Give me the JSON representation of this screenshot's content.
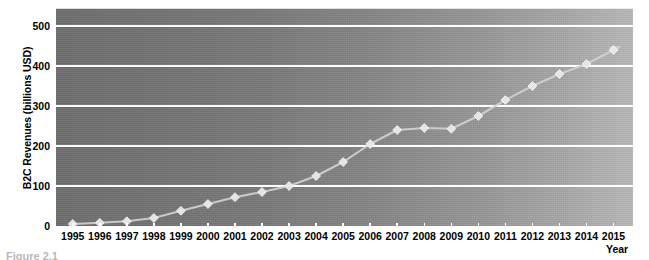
{
  "chart_data": {
    "type": "line",
    "title": "",
    "xlabel": "Year",
    "ylabel": "B2C Revenues (billions USD)",
    "categories": [
      1995,
      1996,
      1997,
      1998,
      1999,
      2000,
      2001,
      2002,
      2003,
      2004,
      2005,
      2006,
      2007,
      2008,
      2009,
      2010,
      2011,
      2012,
      2013,
      2014,
      2015
    ],
    "x_tick_labels": [
      "1995",
      "1996",
      "1997",
      "1998",
      "1999",
      "2000",
      "2001",
      "2002",
      "2003",
      "2004",
      "2005",
      "2006",
      "2007",
      "2008",
      "2009",
      "2010",
      "2011",
      "2012",
      "2013",
      "2014",
      "2015"
    ],
    "values": [
      5,
      8,
      12,
      20,
      38,
      55,
      72,
      85,
      100,
      125,
      160,
      205,
      240,
      245,
      243,
      275,
      315,
      350,
      380,
      405,
      440
    ],
    "series": [
      {
        "name": "B2C Revenues",
        "values": [
          5,
          8,
          12,
          20,
          38,
          55,
          72,
          85,
          100,
          125,
          160,
          205,
          240,
          245,
          243,
          275,
          315,
          350,
          380,
          405,
          440
        ]
      }
    ],
    "ylim": [
      0,
      530
    ],
    "y_ticks": [
      0,
      100,
      200,
      300,
      400,
      500
    ],
    "y_tick_labels": [
      "0",
      "100",
      "200",
      "300",
      "400",
      "500"
    ],
    "xlim": [
      1994.6,
      2015.6
    ],
    "grid": "horizontal",
    "legend": "none",
    "marker": "diamond",
    "line_end_arrow": true,
    "colors": {
      "gridline": "#ffffff",
      "axis": "#ffffff",
      "line": "#d0d0d0",
      "marker_fill": "#e8e8e8",
      "marker_edge": "#f4f4f4",
      "plot_bg_left": "#6f6f6f",
      "plot_bg_right": "#b8b8b8",
      "page_bg": "#ffffff",
      "text": "#000000"
    }
  },
  "caption": {
    "fragment": "Figure 2.1"
  }
}
